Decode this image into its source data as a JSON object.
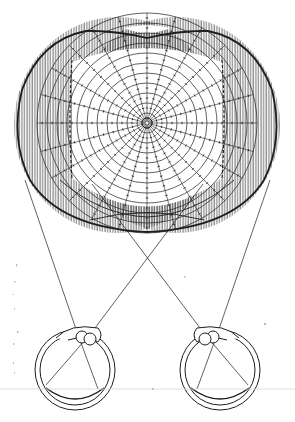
{
  "diagram": {
    "colors": {
      "ink": "#1e1e1e",
      "hatch": "#3a3a3a",
      "background": "#ffffff",
      "baseline": "#d6d6d6"
    },
    "perimetry_grid": {
      "center": [
        147,
        123
      ],
      "ring_count": 11,
      "ring_radii": [
        10,
        20,
        30,
        40,
        50,
        60,
        70,
        80,
        90,
        100,
        110
      ],
      "radial_line_count": 24,
      "tick_marks": true
    },
    "visual_fields": {
      "left_eye_field": {
        "center": [
          118,
          125
        ],
        "rx": 104,
        "ry": 108
      },
      "right_eye_field": {
        "center": [
          176,
          125
        ],
        "rx": 104,
        "ry": 108
      },
      "outer_boundary_bbox": [
        14,
        28,
        280,
        232
      ],
      "monocular_crescents": "vertical-hatching",
      "binocular_overlap": "unshaded-center"
    },
    "eyes": [
      {
        "name": "left-eye",
        "center": [
          75,
          370
        ],
        "r_outer": 40,
        "r_inner": 35
      },
      {
        "name": "right-eye",
        "center": [
          220,
          370
        ],
        "r_outer": 40,
        "r_inner": 35
      }
    ],
    "sight_lines": {
      "crossing_point": [
        147,
        258
      ]
    },
    "baseline_y": 389
  }
}
